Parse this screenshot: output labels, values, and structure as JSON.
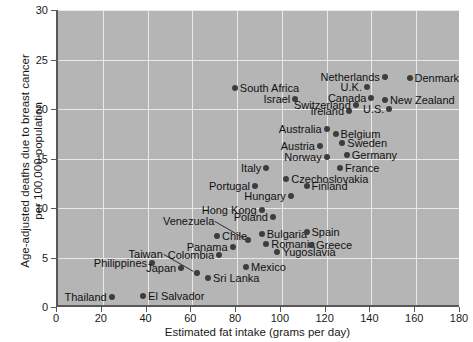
{
  "chart_data": {
    "type": "scatter",
    "title": "",
    "xlabel": "Estimated fat intake (grams per day)",
    "ylabel": "Age-adjusted deaths due to breast cancer per 100,000 population",
    "ylabel_line1": "Age-adjusted deaths due to breast cancer",
    "ylabel_line2": "per 100,000 population",
    "xlim": [
      0,
      180
    ],
    "ylim": [
      0,
      30
    ],
    "xticks": [
      0,
      20,
      40,
      60,
      80,
      100,
      120,
      140,
      160,
      180
    ],
    "yticks": [
      0,
      5,
      10,
      15,
      20,
      25,
      30
    ],
    "grid": true,
    "legend": "none",
    "plot_bg": "#b5b5b5",
    "gridline_color": "#e9e9e9",
    "marker_color": "#3d3d3d",
    "points": [
      {
        "name": "Thailand",
        "x": 24,
        "y": 1.0,
        "side": "r"
      },
      {
        "name": "El Salvador",
        "x": 38,
        "y": 1.1,
        "side": "l"
      },
      {
        "name": "Philippines",
        "x": 42,
        "y": 4.4,
        "side": "r"
      },
      {
        "name": "Japan",
        "x": 55,
        "y": 3.9,
        "side": "r"
      },
      {
        "name": "Taiwan",
        "x": 62,
        "y": 3.4,
        "side": "leader"
      },
      {
        "name": "Sri Lanka",
        "x": 67,
        "y": 2.9,
        "side": "l"
      },
      {
        "name": "Mexico",
        "x": 84,
        "y": 4.0,
        "side": "l"
      },
      {
        "name": "Colombia",
        "x": 72,
        "y": 5.3,
        "side": "r"
      },
      {
        "name": "Panama",
        "x": 78,
        "y": 6.1,
        "side": "r"
      },
      {
        "name": "Chile",
        "x": 71,
        "y": 7.2,
        "side": "l"
      },
      {
        "name": "Venezuela",
        "x": 85,
        "y": 6.8,
        "side": "leader"
      },
      {
        "name": "Yugoslavia",
        "x": 98,
        "y": 5.6,
        "side": "l"
      },
      {
        "name": "Romania",
        "x": 93,
        "y": 6.4,
        "side": "l"
      },
      {
        "name": "Bulgaria",
        "x": 91,
        "y": 7.4,
        "side": "l"
      },
      {
        "name": "Greece",
        "x": 113,
        "y": 6.3,
        "side": "l"
      },
      {
        "name": "Spain",
        "x": 111,
        "y": 7.6,
        "side": "l"
      },
      {
        "name": "Hong Kong",
        "x": 91,
        "y": 9.8,
        "side": "r"
      },
      {
        "name": "Poland",
        "x": 96,
        "y": 9.1,
        "side": "r"
      },
      {
        "name": "Hungary",
        "x": 104,
        "y": 11.2,
        "side": "r"
      },
      {
        "name": "Portugal",
        "x": 88,
        "y": 12.2,
        "side": "r"
      },
      {
        "name": "Czechoslovakia",
        "x": 102,
        "y": 12.9,
        "side": "l"
      },
      {
        "name": "Finland",
        "x": 111,
        "y": 12.2,
        "side": "l"
      },
      {
        "name": "Italy",
        "x": 93,
        "y": 14.0,
        "side": "r"
      },
      {
        "name": "Norway",
        "x": 120,
        "y": 15.2,
        "side": "r"
      },
      {
        "name": "Austria",
        "x": 117,
        "y": 16.3,
        "side": "r"
      },
      {
        "name": "France",
        "x": 126,
        "y": 14.0,
        "side": "l"
      },
      {
        "name": "Germany",
        "x": 129,
        "y": 15.4,
        "side": "l"
      },
      {
        "name": "Sweden",
        "x": 127,
        "y": 16.6,
        "side": "l"
      },
      {
        "name": "Australia",
        "x": 120,
        "y": 18.0,
        "side": "r"
      },
      {
        "name": "Belgium",
        "x": 124,
        "y": 17.5,
        "side": "l"
      },
      {
        "name": "Israel",
        "x": 106,
        "y": 21.0,
        "side": "r"
      },
      {
        "name": "South Africa",
        "x": 79,
        "y": 22.1,
        "side": "l"
      },
      {
        "name": "Ireland",
        "x": 130,
        "y": 19.8,
        "side": "r"
      },
      {
        "name": "Switzerland",
        "x": 133,
        "y": 20.4,
        "side": "r"
      },
      {
        "name": "U.S.",
        "x": 148,
        "y": 20.0,
        "side": "r"
      },
      {
        "name": "Canada",
        "x": 140,
        "y": 21.1,
        "side": "r"
      },
      {
        "name": "New Zealand",
        "x": 146,
        "y": 20.9,
        "side": "l"
      },
      {
        "name": "U.K.",
        "x": 138,
        "y": 22.2,
        "side": "r"
      },
      {
        "name": "Netherlands",
        "x": 146,
        "y": 23.2,
        "side": "r"
      },
      {
        "name": "Denmark",
        "x": 157,
        "y": 23.1,
        "side": "l"
      }
    ]
  }
}
